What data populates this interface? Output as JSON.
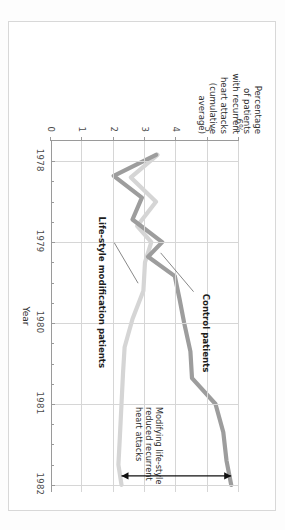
{
  "figure": {
    "y_axis_title": "Percentage of patients with recurrent heart attacks (cumulative average)",
    "x_axis_title": "Year"
  },
  "chart_data": {
    "type": "line",
    "title": "",
    "xlabel": "Year",
    "ylabel": "Percentage of patients with recurrent heart attacks (cumulative average)",
    "grid": true,
    "legend_position": "inline-labels",
    "xlim": [
      1977.75,
      1982.1
    ],
    "ylim": [
      0,
      6
    ],
    "ytick_labels": [
      "0",
      "1",
      "2",
      "3",
      "4",
      "5",
      "6%"
    ],
    "ytick_values": [
      0,
      1,
      2,
      3,
      4,
      5,
      6
    ],
    "xtick_labels": [
      "1978",
      "1979",
      "1980",
      "1981",
      "1982"
    ],
    "xtick_values": [
      1978,
      1979,
      1980,
      1981,
      1982
    ],
    "x_minor_ticks": [
      1978.25,
      1978.5,
      1978.75,
      1979.25,
      1979.5,
      1979.75,
      1980.25,
      1980.5,
      1980.75,
      1981.25,
      1981.5,
      1981.75
    ],
    "series": [
      {
        "name": "Control patients",
        "color": "#9d9d9d",
        "x": [
          1977.92,
          1978.18,
          1978.45,
          1978.72,
          1979.0,
          1979.18,
          1979.42,
          1979.7,
          1980.0,
          1980.35,
          1980.68,
          1981.0,
          1981.35,
          1981.7,
          1982.0
        ],
        "values": [
          3.35,
          2.0,
          2.9,
          2.6,
          3.55,
          3.1,
          3.95,
          4.1,
          4.25,
          4.45,
          4.5,
          5.25,
          5.5,
          5.6,
          5.75
        ]
      },
      {
        "name": "Life-style modification patients",
        "color": "#d5d5d5",
        "x": [
          1977.92,
          1978.2,
          1978.5,
          1978.8,
          1979.0,
          1979.25,
          1979.6,
          1979.95,
          1980.3,
          1980.6,
          1981.0,
          1981.4,
          1981.75,
          1982.0
        ],
        "values": [
          3.4,
          2.55,
          3.35,
          2.75,
          3.2,
          3.0,
          2.95,
          2.6,
          2.35,
          2.3,
          2.25,
          2.2,
          2.15,
          2.25
        ]
      }
    ],
    "annotations": [
      {
        "name": "control-patients-label",
        "text": "Control patients"
      },
      {
        "name": "lifestyle-label",
        "text": "Life-style modification patients"
      },
      {
        "name": "conclusion-note",
        "text": "Modifying life-style\nreduced recurrent\nheart attacks"
      }
    ],
    "annotation_lines": [
      {
        "text": "Modifying life-style"
      },
      {
        "text": "reduced recurrent"
      },
      {
        "text": "heart attacks"
      }
    ],
    "difference_arrow": {
      "name": "difference-arrow",
      "description": "double-headed arrow spanning the gap between the two series at 1982",
      "at_x": 1982,
      "from_value": 2.25,
      "to_value": 5.75
    }
  }
}
